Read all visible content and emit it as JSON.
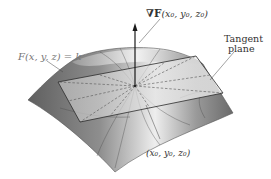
{
  "figure": {
    "labels": {
      "surface": "F(x, y, z) = k",
      "gradient_prefix": "∇F",
      "gradient_args": "(x₀, y₀, z₀)",
      "tangent_line1": "Tangent",
      "tangent_line2": "plane",
      "point": "(x₀, y₀, z₀)"
    },
    "colors": {
      "surface_dark": "#6e6e6e",
      "surface_light": "#e8e8e8",
      "plane_fill": "#d9d9d9",
      "plane_edge": "#2b2b2b",
      "arrow": "#1a1a1a",
      "dashed": "#555555"
    },
    "point": {
      "x": 135,
      "y": 86
    }
  }
}
